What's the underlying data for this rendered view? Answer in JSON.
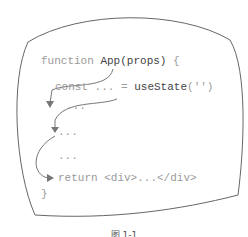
{
  "diagram": {
    "lines": [
      {
        "prefix": "function ",
        "strong": "App(props)",
        "suffix": " {"
      },
      {
        "prefix": "const ... = ",
        "strong": "useState",
        "suffix": "('')"
      },
      {
        "text": "..."
      },
      {
        "text": "..."
      },
      {
        "text": "..."
      },
      {
        "text": "return <div>...</div>"
      },
      {
        "text": "}"
      }
    ],
    "caption": "图 1-1",
    "colors": {
      "outline": "#666666",
      "code_light": "#9a9a9a",
      "code_dark": "#444444"
    }
  }
}
